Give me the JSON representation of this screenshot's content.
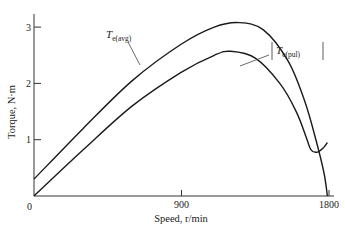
{
  "chart_data": {
    "type": "line",
    "title": "",
    "xlabel": "Speed, r/min",
    "ylabel": "Torque, N·m",
    "xlim": [
      0,
      1800
    ],
    "ylim": [
      0,
      3.2
    ],
    "x_ticks": [
      0,
      900,
      1800
    ],
    "x_tick_labels": [
      "0",
      "900",
      "1800"
    ],
    "y_ticks": [
      1,
      2,
      3
    ],
    "y_tick_labels": [
      "1",
      "2",
      "3"
    ],
    "grid": false,
    "legend": "none (inline annotations)",
    "series": [
      {
        "name": "T_e(avg)",
        "label_main": "T",
        "label_sub": "e(avg)",
        "points": [
          [
            0,
            0.3
          ],
          [
            300,
            1.2
          ],
          [
            600,
            2.05
          ],
          [
            900,
            2.7
          ],
          [
            1100,
            3.0
          ],
          [
            1250,
            3.08
          ],
          [
            1400,
            2.95
          ],
          [
            1550,
            2.4
          ],
          [
            1650,
            1.7
          ],
          [
            1720,
            1.0
          ],
          [
            1770,
            0.4
          ],
          [
            1790,
            0.0
          ]
        ]
      },
      {
        "name": "|T_e(pul)|",
        "label_main": "T",
        "label_sub": "e(pul)",
        "points": [
          [
            0,
            0.0
          ],
          [
            300,
            0.82
          ],
          [
            600,
            1.6
          ],
          [
            900,
            2.2
          ],
          [
            1100,
            2.5
          ],
          [
            1200,
            2.57
          ],
          [
            1350,
            2.45
          ],
          [
            1500,
            2.0
          ],
          [
            1600,
            1.5
          ],
          [
            1660,
            1.05
          ],
          [
            1690,
            0.82
          ],
          [
            1730,
            0.78
          ],
          [
            1770,
            0.87
          ],
          [
            1790,
            0.95
          ]
        ]
      }
    ]
  }
}
